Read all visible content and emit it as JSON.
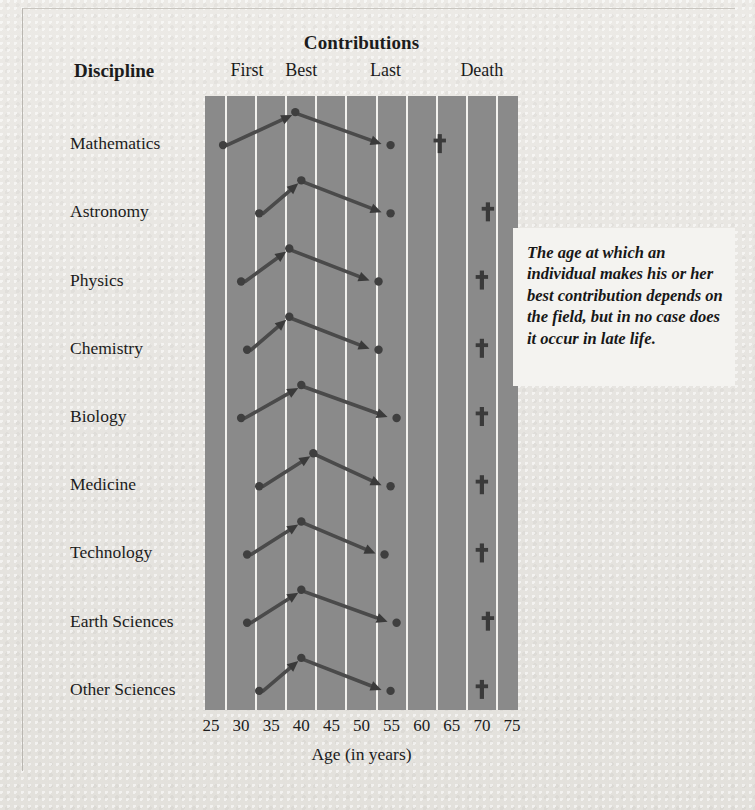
{
  "header": {
    "contributions_title": "Contributions",
    "discipline_header": "Discipline",
    "columns": [
      "First",
      "Best",
      "Last",
      "Death"
    ]
  },
  "axis": {
    "title": "Age (in years)",
    "ticks": [
      25,
      30,
      35,
      40,
      45,
      50,
      55,
      60,
      65,
      70,
      75
    ],
    "min": 24,
    "max": 76
  },
  "callout": {
    "text": "The age at which an individual makes his or her best contribution depends on the field, but in no case does it occur in late life."
  },
  "colors": {
    "page_background": "#e9e8e4",
    "plot_background": "#8a8a8a",
    "gridline": "#f2f1ee",
    "marker": "#3f3f3f",
    "arrow": "#4a4a4a",
    "callout_background": "#f4f3f0",
    "text": "#1c1c1c"
  },
  "chart_data": {
    "type": "line",
    "title": "Contributions",
    "xlabel": "Age (in years)",
    "ylabel": "Discipline",
    "xlim": [
      24,
      76
    ],
    "grid": true,
    "legend": "none",
    "categories": [
      "Mathematics",
      "Astronomy",
      "Physics",
      "Chemistry",
      "Biology",
      "Medicine",
      "Technology",
      "Earth Sciences",
      "Other Sciences"
    ],
    "series": [
      {
        "name": "First",
        "values": [
          27,
          33,
          30,
          31,
          30,
          33,
          31,
          31,
          33
        ]
      },
      {
        "name": "Best",
        "values": [
          39,
          40,
          38,
          38,
          40,
          42,
          40,
          40,
          40
        ]
      },
      {
        "name": "Last",
        "values": [
          54,
          54,
          52,
          52,
          55,
          54,
          53,
          55,
          54
        ]
      },
      {
        "name": "Death",
        "values": [
          63,
          71,
          70,
          70,
          70,
          70,
          70,
          71,
          70
        ]
      }
    ],
    "rows": [
      {
        "discipline": "Mathematics",
        "first": 27,
        "best": 39,
        "last": 54,
        "death": 63
      },
      {
        "discipline": "Astronomy",
        "first": 33,
        "best": 40,
        "last": 54,
        "death": 71
      },
      {
        "discipline": "Physics",
        "first": 30,
        "best": 38,
        "last": 52,
        "death": 70
      },
      {
        "discipline": "Chemistry",
        "first": 31,
        "best": 38,
        "last": 52,
        "death": 70
      },
      {
        "discipline": "Biology",
        "first": 30,
        "best": 40,
        "last": 55,
        "death": 70
      },
      {
        "discipline": "Medicine",
        "first": 33,
        "best": 42,
        "last": 54,
        "death": 70
      },
      {
        "discipline": "Technology",
        "first": 31,
        "best": 40,
        "last": 53,
        "death": 70
      },
      {
        "discipline": "Earth Sciences",
        "first": 31,
        "best": 40,
        "last": 55,
        "death": 71
      },
      {
        "discipline": "Other Sciences",
        "first": 33,
        "best": 40,
        "last": 54,
        "death": 70
      }
    ]
  }
}
